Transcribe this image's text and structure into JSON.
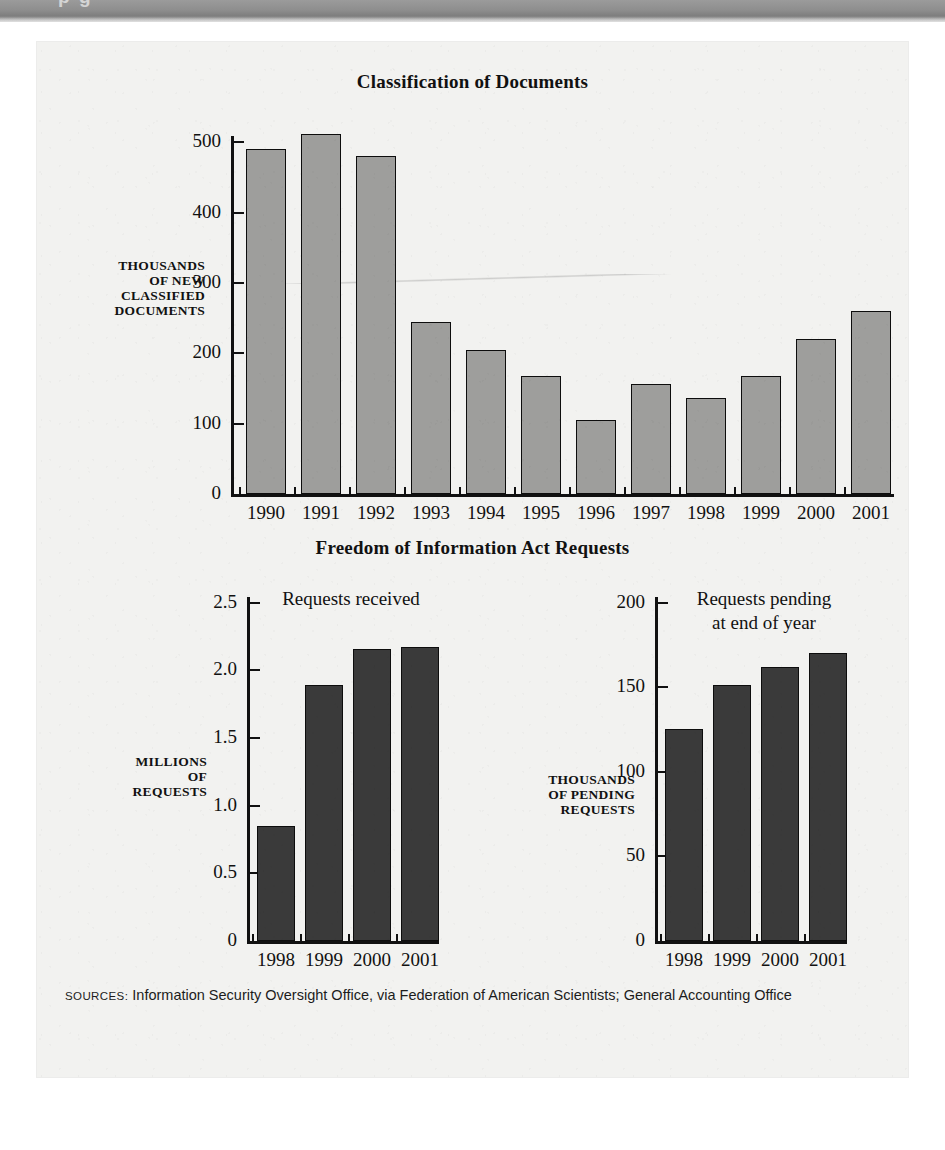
{
  "banner": {
    "clipped_text": "p g"
  },
  "figure": {
    "top_chart_title": "Classification of Documents",
    "bottom_chart_title": "Freedom of Information Act Requests",
    "sources_label": "SOURCES:",
    "sources_text": " Information Security Oversight Office, via Federation of American Scientists; General Accounting Office"
  },
  "chart_data": [
    {
      "type": "bar",
      "title": "Classification of Documents",
      "categories": [
        "1990",
        "1991",
        "1992",
        "1993",
        "1994",
        "1995",
        "1996",
        "1997",
        "1998",
        "1999",
        "2000",
        "2001"
      ],
      "values": [
        490,
        512,
        480,
        245,
        204,
        167,
        105,
        157,
        136,
        168,
        220,
        260
      ],
      "xlabel": "",
      "ylabel": "THOUSANDS OF NEW CLASSIFIED DOCUMENTS",
      "ylabel_lines": [
        "THOUSANDS",
        "OF NEW",
        "CLASSIFIED",
        "DOCUMENTS"
      ],
      "ylim": [
        0,
        540
      ],
      "yticks": [
        0,
        100,
        200,
        300,
        400,
        500
      ],
      "ytick_labels": [
        "0",
        "100",
        "200",
        "300",
        "400",
        "500"
      ],
      "grid": false,
      "legend": "none",
      "bar_color": "#9e9e9c",
      "bar_edge_color": "#0d0d0d",
      "shadow_color": "#c9c9c7"
    },
    {
      "type": "bar",
      "title": "Requests received",
      "categories": [
        "1998",
        "1999",
        "2000",
        "2001"
      ],
      "values": [
        0.85,
        1.89,
        2.16,
        2.17
      ],
      "xlabel": "",
      "ylabel": "MILLIONS OF REQUESTS",
      "ylabel_lines": [
        "MILLIONS",
        "OF",
        "REQUESTS"
      ],
      "ylim": [
        0,
        2.6
      ],
      "yticks": [
        0,
        0.5,
        1.0,
        1.5,
        2.0,
        2.5
      ],
      "ytick_labels": [
        "0",
        "0.5",
        "1.0",
        "1.5",
        "2.0",
        "2.5"
      ],
      "annotation": "Requests received",
      "grid": false,
      "legend": "none",
      "bar_color": "#3a3a3a",
      "bar_edge_color": "#0d0d0d",
      "shadow_color": "#c9c9c7"
    },
    {
      "type": "bar",
      "title": "Requests pending at end of year",
      "categories": [
        "1998",
        "1999",
        "2000",
        "2001"
      ],
      "values": [
        125,
        151,
        162,
        170
      ],
      "xlabel": "",
      "ylabel": "THOUSANDS OF PENDING REQUESTS",
      "ylabel_lines": [
        "THOUSANDS",
        "OF PENDING",
        "REQUESTS"
      ],
      "ylim": [
        0,
        208
      ],
      "yticks": [
        0,
        50,
        100,
        150,
        200
      ],
      "ytick_labels": [
        "0",
        "50",
        "100",
        "150",
        "200"
      ],
      "annotation_lines": [
        "Requests pending",
        "at end of year"
      ],
      "grid": false,
      "legend": "none",
      "bar_color": "#3a3a3a",
      "bar_edge_color": "#0d0d0d",
      "shadow_color": "#c9c9c7"
    }
  ]
}
